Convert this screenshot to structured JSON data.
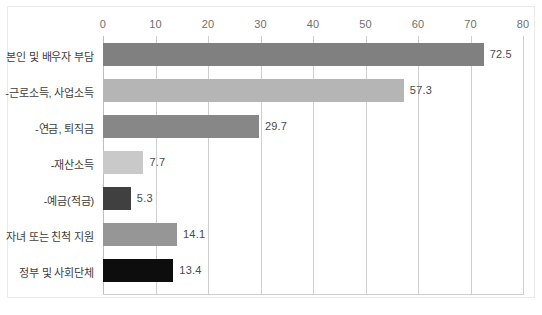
{
  "chart_data": {
    "type": "bar",
    "orientation": "horizontal",
    "title": "",
    "xlabel": "",
    "ylabel": "",
    "xlim": [
      0,
      80
    ],
    "xticks": [
      0,
      10,
      20,
      30,
      40,
      50,
      60,
      70,
      80
    ],
    "xtick_labels": [
      "0",
      "10",
      "20",
      "30",
      "40",
      "50",
      "60",
      "70",
      "80"
    ],
    "grid": true,
    "legend": "none",
    "categories": [
      "본인 및 배우자 부담",
      "-근로소득, 사업소득",
      "-연금, 퇴직금",
      "-재산소득",
      "-예금(적금)",
      "자녀 또는 친척 지원",
      "정부 및 사회단체"
    ],
    "values": [
      72.5,
      57.3,
      29.7,
      7.7,
      5.3,
      14.1,
      13.4
    ],
    "value_labels": [
      "72.5",
      "57.3",
      "29.7",
      "7.7",
      "5.3",
      "14.1",
      "13.4"
    ],
    "bar_colors": [
      "#808080",
      "#b5b5b5",
      "#878787",
      "#c9c9c9",
      "#404040",
      "#969696",
      "#0d0d0d"
    ]
  },
  "colors": {
    "gridline": "#cfcfcf",
    "frame": "#e9e9e9",
    "tick_text": "#6f6f6f",
    "category_text": "#3d3d3d",
    "value_text": "#4a4a4a",
    "background": "#ffffff"
  }
}
